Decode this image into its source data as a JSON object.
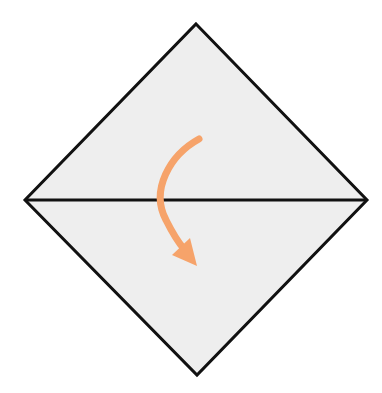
{
  "diagram": {
    "type": "origami-fold-step",
    "colors": {
      "paper": "#eeeeee",
      "outline": "#111111",
      "crease": "#111111",
      "arrow": "#f6a36a",
      "background": "#ffffff"
    },
    "shape": {
      "top": [
        196,
        24
      ],
      "right": [
        367,
        200
      ],
      "bottom": [
        197,
        375
      ],
      "left": [
        25,
        200
      ]
    },
    "crease_line": {
      "from": [
        25,
        200
      ],
      "to": [
        367,
        200
      ]
    },
    "arrow": {
      "direction": "fold-down",
      "start": [
        199,
        139
      ],
      "control": [
        140,
        190
      ],
      "end": [
        184,
        250
      ],
      "head_tip": [
        197,
        265
      ]
    }
  }
}
